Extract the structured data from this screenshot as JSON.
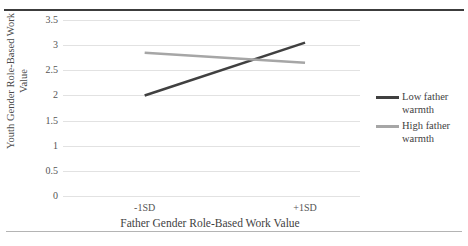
{
  "chart_data": {
    "type": "line",
    "title": "",
    "xlabel": "Father Gender Role-Based Work Value",
    "ylabel": "Youth Gender Role-Based Work Value",
    "ylabel_line1": "Youth Gender Role-Based Work",
    "ylabel_line2": "Value",
    "categories": [
      "-1SD",
      "+1SD"
    ],
    "ylim": [
      0,
      3.5
    ],
    "yticks": [
      "0",
      "0.5",
      "1",
      "1.5",
      "2",
      "2.5",
      "3",
      "3.5"
    ],
    "ytick_values": [
      0,
      0.5,
      1,
      1.5,
      2,
      2.5,
      3,
      3.5
    ],
    "grid": true,
    "legend_position": "right",
    "series": [
      {
        "name": "Low father warmth",
        "name_line1": "Low father",
        "name_line2": "warmth",
        "values": [
          2.0,
          3.05
        ],
        "color": "#404040"
      },
      {
        "name": "High father warmth",
        "name_line1": "High father",
        "name_line2": "warmth",
        "values": [
          2.85,
          2.65
        ],
        "color": "#a6a6a6"
      }
    ]
  },
  "colors": {
    "low_father_warmth": "#404040",
    "high_father_warmth": "#a6a6a6",
    "gridline": "#e2e2e2",
    "rule_top": "#3c3c3c",
    "rule_bottom": "#b4b4b4"
  }
}
